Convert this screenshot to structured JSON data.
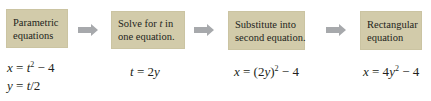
{
  "diagram": {
    "title": "",
    "colors": {
      "box_fill": "#d2cbaa",
      "arrow_fill": "#a7a9ac",
      "text": "#231f20"
    },
    "steps": [
      {
        "lines": [
          "Parametric",
          "equations"
        ]
      },
      {
        "lines": [
          "Solve for t in",
          "one equation."
        ]
      },
      {
        "lines": [
          "Substitute into",
          "second equation."
        ]
      },
      {
        "lines": [
          "Rectangular",
          "equation"
        ]
      }
    ],
    "arrows": [
      "right-arrow",
      "right-arrow",
      "right-arrow"
    ],
    "equations": [
      [
        "x = t² − 4",
        "y = t/2"
      ],
      [
        "t = 2y"
      ],
      [
        "x = (2y)² − 4"
      ],
      [
        "x = 4y² − 4"
      ]
    ]
  }
}
